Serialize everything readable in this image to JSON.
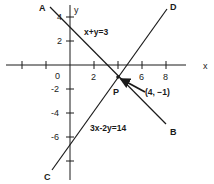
{
  "figure": {
    "axes": {
      "x_label": "x",
      "y_label": "y",
      "origin_label": "0",
      "x_ticks": [
        {
          "value": -4,
          "label": ""
        },
        {
          "value": -2,
          "label": ""
        },
        {
          "value": 2,
          "label": "2"
        },
        {
          "value": 4,
          "label": ""
        },
        {
          "value": 6,
          "label": "6"
        },
        {
          "value": 8,
          "label": "8"
        }
      ],
      "y_ticks": [
        {
          "value": 4,
          "label": "4"
        },
        {
          "value": 2,
          "label": "2"
        },
        {
          "value": -2,
          "label": "-2"
        },
        {
          "value": -4,
          "label": "-4"
        },
        {
          "value": -6,
          "label": "-6"
        },
        {
          "value": -8,
          "label": ""
        }
      ]
    },
    "lines": [
      {
        "equation": "x+y=3",
        "start_label": "A",
        "end_label": "B"
      },
      {
        "equation": "3x-2y=14",
        "start_label": "C",
        "end_label": "D"
      }
    ],
    "intersection": {
      "point_label": "P",
      "coord_label": "(4, −1)",
      "x": 4,
      "y": -1
    },
    "colors": {
      "ink": "#1a1a1a",
      "background": "#ffffff"
    }
  }
}
